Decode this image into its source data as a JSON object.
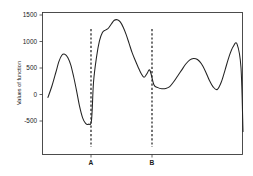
{
  "chart_data": {
    "type": "line",
    "title": "",
    "subtitle": "",
    "xlabel": "",
    "ylabel": "Values of function",
    "ylim": [
      -750,
      1550
    ],
    "xlim": [
      0,
      100
    ],
    "grid": false,
    "legend": null,
    "y_ticks": [
      {
        "value": 1500,
        "label": "1500"
      },
      {
        "value": 1000,
        "label": "1000"
      },
      {
        "value": 500,
        "label": "500"
      },
      {
        "value": 0,
        "label": "0"
      },
      {
        "value": -500,
        "label": "-500"
      }
    ],
    "x_ticks": [
      {
        "value": 24.5,
        "label": "A"
      },
      {
        "value": 55.0,
        "label": "B"
      }
    ],
    "annotations": [
      {
        "name": "vline-A",
        "type": "vertical-dashed-line",
        "x": 24.5,
        "label": "A",
        "color": "#111111"
      },
      {
        "name": "vline-B",
        "type": "vertical-dashed-line",
        "x": 55.0,
        "label": "B",
        "color": "#111111"
      }
    ],
    "series": [
      {
        "name": "function",
        "color": "#222222",
        "x": [
          1.5,
          3.5,
          5.5,
          7.0,
          8.5,
          10.0,
          11.5,
          13.0,
          14.5,
          16.0,
          17.5,
          19.0,
          20.5,
          22.0,
          23.5,
          24.5,
          26.0,
          27.5,
          29.0,
          30.5,
          32.0,
          33.5,
          35.0,
          36.5,
          38.0,
          39.5,
          41.0,
          42.5,
          44.0,
          45.5,
          47.0,
          48.5,
          50.0,
          51.5,
          53.0,
          55.0,
          57.0,
          59.0,
          61.0,
          63.0,
          65.0,
          67.0,
          69.0,
          71.0,
          73.0,
          75.0,
          77.0,
          79.0,
          81.0,
          83.0,
          85.0,
          87.0,
          89.0,
          91.0,
          93.0,
          95.0,
          97.0,
          99.0,
          100.0
        ],
        "y": [
          -55,
          160,
          420,
          620,
          740,
          760,
          700,
          560,
          330,
          60,
          -230,
          -440,
          -545,
          -560,
          -480,
          230,
          700,
          1010,
          1170,
          1215,
          1250,
          1330,
          1400,
          1410,
          1370,
          1270,
          1130,
          960,
          790,
          650,
          520,
          400,
          325,
          395,
          455,
          185,
          130,
          110,
          115,
          150,
          240,
          350,
          460,
          570,
          650,
          680,
          660,
          580,
          440,
          270,
          140,
          95,
          230,
          470,
          720,
          900,
          950,
          500,
          -700
        ]
      }
    ]
  },
  "axes": {
    "y_axis_title": "Values of function",
    "frame_color": "#3a3a3a"
  }
}
